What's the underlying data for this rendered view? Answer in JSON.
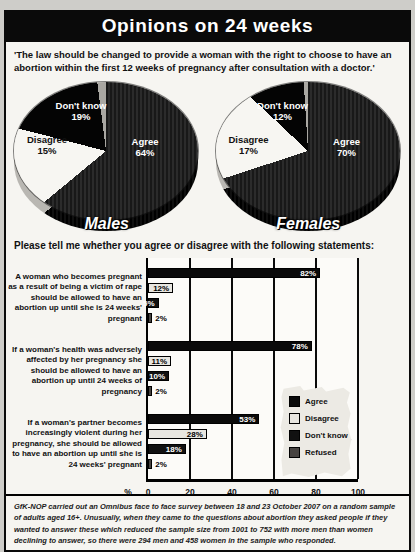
{
  "header": {
    "title": "Opinions on 24 weeks"
  },
  "intro": {
    "quote": "'The law should be changed to provide a woman with the right to choose to have an abortion within the first 12 weeks of pregnancy after consultation with a doctor.'"
  },
  "statements_section": {
    "heading": "Please tell me whether you agree or disagree with the following statements:"
  },
  "footnote": {
    "text": "GfK-NOP carried out an Omnibus face to face survey between 18 and 23 October 2007 on a random sample of adults aged 16+. Unusually, when they came to the questions about abortion they asked people if they wanted to answer these which reduced the sample size from 1001 to 752 with more men than women declining to answer, so there were 294 men and 458 women in the sample who responded.",
    "source": "GfK-NOP"
  },
  "colors": {
    "title_bar": "#0a0a0a",
    "page_bg": "#cecdc9",
    "panel_bg": "#f6f5f1",
    "pie_agree": "#181818",
    "pie_agree_stripe": "#2b2b2b",
    "pie_disagree": "#f7f6f2",
    "pie_dont_know": "#040404",
    "pie_sliver": "#a9a7a2",
    "series": {
      "Agree": "#0a0a0a",
      "Disagree": "#e8e6e0",
      "Don't know": "#111111",
      "Refused": "#474340"
    }
  },
  "chart_data": [
    {
      "type": "pie",
      "title": "Males",
      "slices": [
        {
          "label": "Agree",
          "value": 64
        },
        {
          "label": "Disagree",
          "value": 15
        },
        {
          "label": "Don't know",
          "value": 19
        },
        {
          "label": "",
          "value": 2
        }
      ]
    },
    {
      "type": "pie",
      "title": "Females",
      "slices": [
        {
          "label": "Agree",
          "value": 70
        },
        {
          "label": "Disagree",
          "value": 17
        },
        {
          "label": "Don't know",
          "value": 12
        },
        {
          "label": "",
          "value": 1
        }
      ]
    },
    {
      "type": "bar",
      "orientation": "horizontal",
      "xlabel": "%",
      "xlim": [
        0,
        100
      ],
      "ticks": [
        0,
        20,
        40,
        60,
        80,
        100
      ],
      "grid": true,
      "legend_position": "lower right",
      "categories": [
        "A woman who becomes pregnant as a result of being a victim of rape should be allowed to have an abortion up until she is 24 weeks' pregnant",
        "If a woman's health was adversely affected by her pregnancy she should be allowed to have an abortion up until 24 weeks of pregnancy",
        "If a woman's partner becomes increasingly violent during her pregnancy, she should be allowed to have an abortion up until she is 24 weeks' pregnant"
      ],
      "series": [
        {
          "name": "Agree",
          "values": [
            82,
            78,
            53
          ]
        },
        {
          "name": "Disagree",
          "values": [
            12,
            11,
            28
          ]
        },
        {
          "name": "Don't know",
          "values": [
            5,
            10,
            18
          ]
        },
        {
          "name": "Refused",
          "values": [
            2,
            2,
            2
          ]
        }
      ]
    }
  ]
}
